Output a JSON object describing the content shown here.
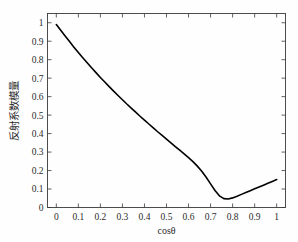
{
  "chart_data": {
    "type": "line",
    "title": "",
    "xlabel": "cosθ",
    "ylabel": "反射系数模量",
    "xlim": [
      -0.04,
      1.04
    ],
    "ylim": [
      0,
      1.05
    ],
    "xticks": [
      0,
      0.1,
      0.2,
      0.3,
      0.4,
      0.5,
      0.6,
      0.7,
      0.8,
      0.9,
      1
    ],
    "xticklabels": [
      "0",
      "0.1",
      "0.2",
      "0.3",
      "0.4",
      "0.5",
      "0.6",
      "0.7",
      "0.8",
      "0.9",
      "1"
    ],
    "yticks": [
      0,
      0.1,
      0.2,
      0.3,
      0.4,
      0.5,
      0.6,
      0.7,
      0.8,
      0.9,
      1
    ],
    "yticklabels": [
      "0",
      "0.1",
      "0.2",
      "0.3",
      "0.4",
      "0.5",
      "0.6",
      "0.7",
      "0.8",
      "0.9",
      "1"
    ],
    "grid": false,
    "legend": null,
    "line_color": "#000000",
    "series": [
      {
        "name": "反射系数模量",
        "x": [
          0.0,
          0.02,
          0.04,
          0.06,
          0.08,
          0.1,
          0.12,
          0.14,
          0.16,
          0.18,
          0.2,
          0.22,
          0.24,
          0.26,
          0.28,
          0.3,
          0.32,
          0.34,
          0.36,
          0.38,
          0.4,
          0.42,
          0.44,
          0.46,
          0.48,
          0.5,
          0.52,
          0.54,
          0.56,
          0.58,
          0.6,
          0.62,
          0.64,
          0.66,
          0.68,
          0.7,
          0.72,
          0.74,
          0.76,
          0.78,
          0.8,
          0.82,
          0.84,
          0.86,
          0.88,
          0.9,
          0.92,
          0.94,
          0.96,
          0.98,
          1.0
        ],
        "y": [
          0.99,
          0.959,
          0.928,
          0.898,
          0.868,
          0.839,
          0.811,
          0.783,
          0.756,
          0.73,
          0.704,
          0.679,
          0.654,
          0.63,
          0.606,
          0.583,
          0.56,
          0.538,
          0.516,
          0.494,
          0.473,
          0.452,
          0.431,
          0.41,
          0.39,
          0.37,
          0.35,
          0.33,
          0.31,
          0.29,
          0.27,
          0.248,
          0.224,
          0.196,
          0.164,
          0.128,
          0.092,
          0.063,
          0.048,
          0.046,
          0.052,
          0.061,
          0.071,
          0.081,
          0.091,
          0.101,
          0.111,
          0.121,
          0.131,
          0.141,
          0.151
        ]
      }
    ],
    "annotations": [
      {
        "label": "minimum",
        "x": 0.66,
        "y": 0.046
      },
      {
        "label": "start",
        "x": 0.0,
        "y": 0.99
      },
      {
        "label": "end",
        "x": 1.0,
        "y": 0.151
      }
    ]
  },
  "figure": {
    "background_color": "#fefefe",
    "axis_color": "#3a3a3a",
    "text_color": "#2b2b2b"
  }
}
